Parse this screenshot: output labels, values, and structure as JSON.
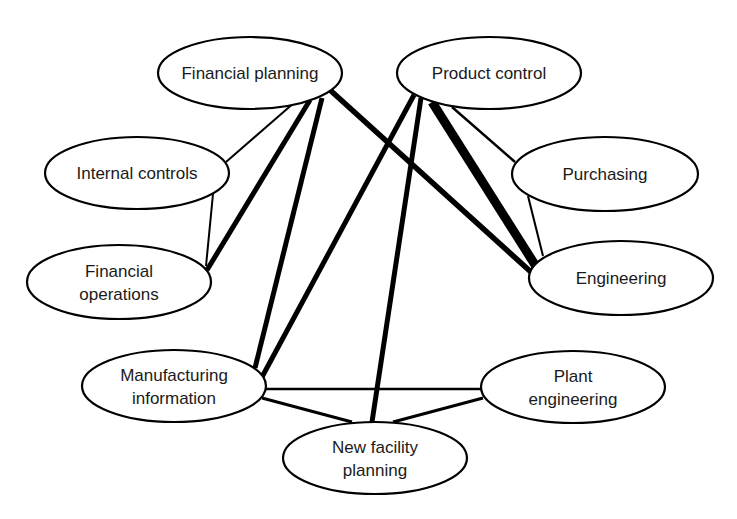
{
  "diagram": {
    "type": "network",
    "nodes": [
      {
        "id": "financial_planning",
        "label_lines": [
          "Financial planning"
        ],
        "cx": 250,
        "cy": 73,
        "rx": 92,
        "ry": 36
      },
      {
        "id": "product_control",
        "label_lines": [
          "Product control"
        ],
        "cx": 489,
        "cy": 73,
        "rx": 92,
        "ry": 36
      },
      {
        "id": "internal_controls",
        "label_lines": [
          "Internal controls"
        ],
        "cx": 137,
        "cy": 173,
        "rx": 92,
        "ry": 36
      },
      {
        "id": "purchasing",
        "label_lines": [
          "Purchasing"
        ],
        "cx": 605,
        "cy": 174,
        "rx": 93,
        "ry": 37
      },
      {
        "id": "financial_operations",
        "label_lines": [
          "Financial",
          "operations"
        ],
        "cx": 119,
        "cy": 282,
        "rx": 92,
        "ry": 37
      },
      {
        "id": "engineering",
        "label_lines": [
          "Engineering"
        ],
        "cx": 621,
        "cy": 278,
        "rx": 92,
        "ry": 37
      },
      {
        "id": "manufacturing_information",
        "label_lines": [
          "Manufacturing",
          "information"
        ],
        "cx": 174,
        "cy": 386,
        "rx": 92,
        "ry": 36
      },
      {
        "id": "plant_engineering",
        "label_lines": [
          "Plant",
          "engineering"
        ],
        "cx": 573,
        "cy": 387,
        "rx": 92,
        "ry": 36
      },
      {
        "id": "new_facility_planning",
        "label_lines": [
          "New facility",
          "planning"
        ],
        "cx": 375,
        "cy": 458,
        "rx": 92,
        "ry": 36
      }
    ],
    "edges": [
      {
        "from": "financial_planning",
        "to": "internal_controls",
        "weight": "thin",
        "width": 2,
        "x1": 295,
        "y1": 102,
        "x2": 226,
        "y2": 162
      },
      {
        "from": "financial_planning",
        "to": "financial_operations",
        "weight": "thick",
        "width": 5,
        "x1": 310,
        "y1": 100,
        "x2": 207,
        "y2": 270
      },
      {
        "from": "financial_planning",
        "to": "manufacturing_information",
        "weight": "thick",
        "width": 5,
        "x1": 322,
        "y1": 98,
        "x2": 255,
        "y2": 368
      },
      {
        "from": "financial_planning",
        "to": "engineering",
        "weight": "thick",
        "width": 5.5,
        "x1": 330,
        "y1": 90,
        "x2": 531,
        "y2": 272
      },
      {
        "from": "internal_controls",
        "to": "financial_operations",
        "weight": "thin",
        "width": 2,
        "x1": 213,
        "y1": 194,
        "x2": 206,
        "y2": 266
      },
      {
        "from": "product_control",
        "to": "manufacturing_information",
        "weight": "thick",
        "width": 5,
        "x1": 414,
        "y1": 95,
        "x2": 262,
        "y2": 377
      },
      {
        "from": "product_control",
        "to": "new_facility_planning",
        "weight": "thick",
        "width": 5,
        "x1": 421,
        "y1": 98,
        "x2": 372,
        "y2": 422
      },
      {
        "from": "product_control",
        "to": "engineering",
        "weight": "very-thick",
        "width": 9,
        "x1": 432,
        "y1": 102,
        "x2": 537,
        "y2": 268
      },
      {
        "from": "product_control",
        "to": "purchasing",
        "weight": "thin",
        "width": 2.5,
        "x1": 452,
        "y1": 107,
        "x2": 515,
        "y2": 162
      },
      {
        "from": "purchasing",
        "to": "engineering",
        "weight": "thin",
        "width": 2,
        "x1": 528,
        "y1": 196,
        "x2": 543,
        "y2": 256
      },
      {
        "from": "manufacturing_information",
        "to": "plant_engineering",
        "weight": "thin",
        "width": 2.5,
        "x1": 265,
        "y1": 389,
        "x2": 482,
        "y2": 389
      },
      {
        "from": "manufacturing_information",
        "to": "new_facility_planning",
        "weight": "medium",
        "width": 3,
        "x1": 262,
        "y1": 398,
        "x2": 352,
        "y2": 422
      },
      {
        "from": "plant_engineering",
        "to": "new_facility_planning",
        "weight": "medium",
        "width": 3,
        "x1": 483,
        "y1": 398,
        "x2": 393,
        "y2": 422
      }
    ]
  }
}
